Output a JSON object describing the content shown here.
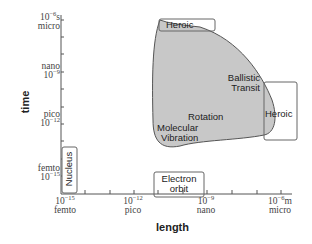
{
  "axes": {
    "y_label": "time",
    "x_label": "length",
    "y_ticks": [
      {
        "exp": "10",
        "sup": "−6",
        "unit_suffix": "s",
        "name": "micro"
      },
      {
        "exp": "10",
        "sup": "−9",
        "unit_suffix": "",
        "name": "nano"
      },
      {
        "exp": "10",
        "sup": "−12",
        "unit_suffix": "",
        "name": "pico"
      },
      {
        "exp": "10",
        "sup": "−15",
        "unit_suffix": "",
        "name": "femto"
      }
    ],
    "x_ticks": [
      {
        "exp": "10",
        "sup": "−15",
        "unit_suffix": "",
        "name": "femto"
      },
      {
        "exp": "10",
        "sup": "−12",
        "unit_suffix": "",
        "name": "pico"
      },
      {
        "exp": "10",
        "sup": "−9",
        "unit_suffix": "",
        "name": "nano"
      },
      {
        "exp": "10",
        "sup": "−6",
        "unit_suffix": "m",
        "name": "micro"
      }
    ]
  },
  "regions": {
    "heroic_top": "Heroic",
    "heroic_right": "Heroic",
    "ballistic_line1": "Ballistic",
    "ballistic_line2": "Transit",
    "rotation": "Rotation",
    "molecular_line1": "Molecular",
    "molecular_line2": "Vibration",
    "nucleus": "Nucleus",
    "electron_line1": "Electron",
    "electron_line2": "orbit"
  },
  "colors": {
    "blob_fill": "#c8c8c8",
    "blob_stroke": "#555555",
    "axis": "#555555",
    "box_stroke": "#666666"
  }
}
